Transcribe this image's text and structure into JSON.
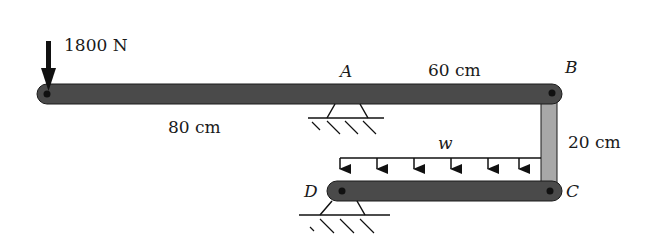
{
  "diagram": {
    "type": "mechanics-free-body",
    "colors": {
      "beam": "#4a4a4a",
      "link": "#a8a8a8",
      "outline": "#1a1a1a",
      "background": "#ffffff"
    },
    "force": {
      "label": "1800 N",
      "direction": "down"
    },
    "points": {
      "A": "A",
      "B": "B",
      "C": "C",
      "D": "D"
    },
    "dimensions": {
      "left_span": "80 cm",
      "right_span": "60 cm",
      "link_height": "20 cm"
    },
    "distributed_load": {
      "label": "w",
      "arrow_count": 6
    },
    "supports": [
      {
        "at": "A",
        "kind": "pin"
      },
      {
        "at": "D",
        "kind": "pin"
      }
    ]
  }
}
